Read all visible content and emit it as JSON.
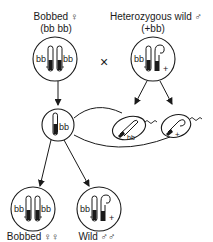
{
  "parents": {
    "female": {
      "label": "Bobbed ♀",
      "genotype": "(bb bb)",
      "alleles": [
        "bb",
        "bb"
      ]
    },
    "male": {
      "label": "Heterozygous wild ♂",
      "genotype": "(+bb)",
      "alleles": [
        "bb",
        "+"
      ]
    }
  },
  "cross_symbol": "×",
  "gametes": {
    "egg": {
      "allele": "bb"
    },
    "sperm": [
      {
        "allele": "bb"
      },
      {
        "allele": "+"
      }
    ]
  },
  "offspring": [
    {
      "label": "Bobbed ♀♀",
      "alleles": [
        "bb",
        "bb"
      ]
    },
    {
      "label": "Wild ♂♂",
      "alleles": [
        "bb",
        "+"
      ]
    }
  ],
  "colors": {
    "ink": "#1a1a1a",
    "background": "#ffffff"
  }
}
